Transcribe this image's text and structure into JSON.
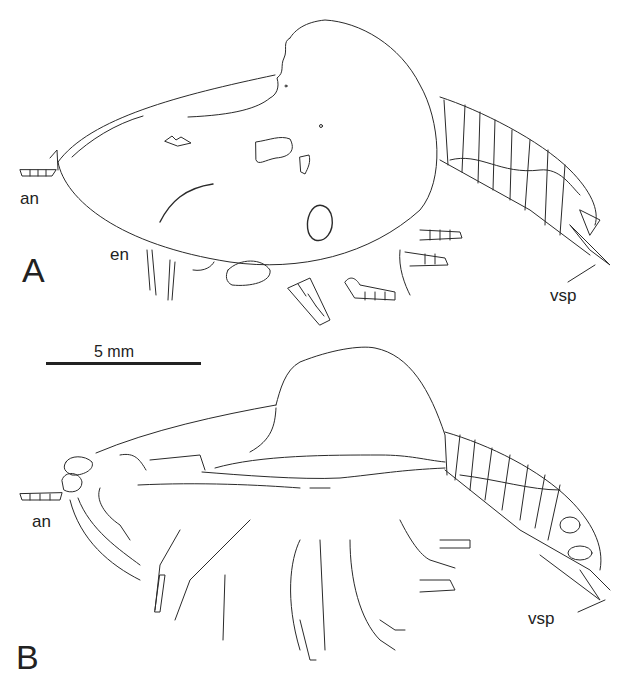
{
  "figure": {
    "panels": [
      {
        "id": "A",
        "label": "A",
        "annotations": [
          {
            "key": "antenna",
            "text": "an"
          },
          {
            "key": "endopod",
            "text": "en"
          },
          {
            "key": "ventral_spine",
            "text": "vsp"
          }
        ]
      },
      {
        "id": "B",
        "label": "B",
        "annotations": [
          {
            "key": "antenna",
            "text": "an"
          },
          {
            "key": "ventral_spine",
            "text": "vsp"
          }
        ]
      }
    ],
    "scale_bar": {
      "text": "5 mm"
    },
    "colors": {
      "line": "#2a2a2a",
      "background": "#ffffff"
    }
  }
}
